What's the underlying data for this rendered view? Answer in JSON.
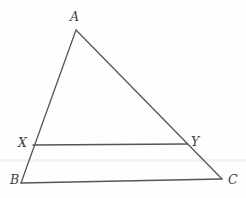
{
  "figure": {
    "kind": "geometry-diagram",
    "width": 246,
    "height": 198,
    "background_color": "#fefefe",
    "stroke_color": "#555555",
    "label_color": "#3c3c3c",
    "artifact_color": "#f7f1f2",
    "labels": [
      {
        "id": "A",
        "text": "A",
        "x": 70,
        "y": 11
      },
      {
        "id": "B",
        "text": "B",
        "x": 10,
        "y": 174
      },
      {
        "id": "C",
        "text": "C",
        "x": 228,
        "y": 174
      },
      {
        "id": "X",
        "text": "X",
        "x": 18,
        "y": 137
      },
      {
        "id": "Y",
        "text": "Y",
        "x": 191,
        "y": 136
      }
    ],
    "points": {
      "A": {
        "x": 76,
        "y": 30
      },
      "B": {
        "x": 21,
        "y": 183
      },
      "C": {
        "x": 222,
        "y": 179
      },
      "X": {
        "x": 33,
        "y": 145
      },
      "Y": {
        "x": 187,
        "y": 144
      }
    },
    "segments": [
      {
        "id": "AB",
        "from": "A",
        "to": "B",
        "width": 1.3
      },
      {
        "id": "AC",
        "from": "A",
        "to": "C",
        "width": 1.3
      },
      {
        "id": "BC",
        "from": "B",
        "to": "C",
        "width": 1.3
      },
      {
        "id": "XY",
        "from": "X",
        "to": "Y",
        "width": 1.3
      }
    ],
    "artifact": {
      "y": 159,
      "height": 3
    }
  }
}
